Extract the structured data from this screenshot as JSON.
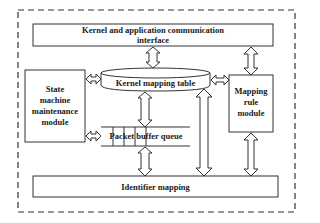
{
  "diagram": {
    "type": "system-architecture-block-diagram",
    "container": {
      "style": "dashed"
    },
    "blocks": {
      "top_interface": {
        "label": "Kernel and application communication interface",
        "line1": "Kernel and application communication",
        "line2": "interface"
      },
      "kernel_table": {
        "label": "Kernel mapping table",
        "shape": "cylinder"
      },
      "state_module": {
        "label": "State machine maintenance module",
        "lines": [
          "State",
          "machine",
          "maintenance",
          "module"
        ]
      },
      "mapping_rule": {
        "label": "Mapping rule module",
        "lines": [
          "Mapping",
          "rule",
          "module"
        ]
      },
      "packet_queue": {
        "label": "Packet buffer queue",
        "shape": "queue"
      },
      "identifier": {
        "label": "Identifier mapping"
      }
    },
    "connections": [
      {
        "from": "top_interface",
        "to": "kernel_table",
        "arrow": "bidirectional"
      },
      {
        "from": "top_interface",
        "to": "mapping_rule",
        "arrow": "bidirectional"
      },
      {
        "from": "state_module",
        "to": "kernel_table",
        "arrow": "bidirectional"
      },
      {
        "from": "kernel_table",
        "to": "mapping_rule",
        "arrow": "bidirectional"
      },
      {
        "from": "kernel_table",
        "to": "packet_queue",
        "arrow": "bidirectional"
      },
      {
        "from": "state_module",
        "to": "packet_queue",
        "arrow": "bidirectional"
      },
      {
        "from": "packet_queue",
        "to": "identifier",
        "arrow": "bidirectional"
      },
      {
        "from": "kernel_table",
        "to": "identifier",
        "arrow": "bidirectional"
      },
      {
        "from": "mapping_rule",
        "to": "identifier",
        "arrow": "bidirectional"
      }
    ],
    "colors": {
      "stroke": "#333333",
      "background": "#ffffff"
    }
  }
}
